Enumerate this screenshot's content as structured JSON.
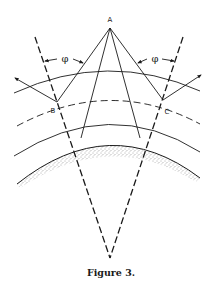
{
  "figure": {
    "caption": "Figure 3.",
    "labels": {
      "A": "A",
      "B": "B",
      "C": "C",
      "phi_left": "φ",
      "phi_right": "φ"
    },
    "colors": {
      "ink": "#1a1a1a",
      "background": "#ffffff",
      "stipple": "#555555"
    },
    "elements": [
      "source point A with four rays fanning down",
      "two dashed radial lines converging below the earth",
      "outer solid arc layer",
      "dashed reflecting arc layer through B and C",
      "inner solid arc layer",
      "stippled earth surface band",
      "angle phi markers on both sides",
      "reflected ray arrows at B and C"
    ]
  }
}
